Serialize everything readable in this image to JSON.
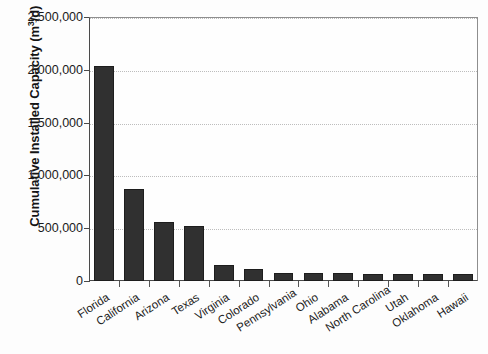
{
  "chart_data": {
    "type": "bar",
    "title": "",
    "xlabel": "",
    "ylabel_plain": "Cumulative Installed Capacity (m3/d)",
    "ylabel_prefix": "Cumulative Installed Capacity (m",
    "ylabel_exponent": "3",
    "ylabel_suffix": "/d)",
    "categories": [
      "Florida",
      "California",
      "Arizona",
      "Texas",
      "Virginia",
      "Colorado",
      "Pennsylvania",
      "Ohio",
      "Alabama",
      "North Carolina",
      "Utah",
      "Oklahoma",
      "Hawaii"
    ],
    "values": [
      2040000,
      875000,
      560000,
      525000,
      150000,
      115000,
      78000,
      75000,
      72000,
      70000,
      70000,
      70000,
      70000
    ],
    "ylim": [
      0,
      2500000
    ],
    "ytick_values": [
      0,
      500000,
      1000000,
      1500000,
      2000000,
      2500000
    ],
    "ytick_labels": [
      "0",
      "500,000",
      "1,000,000",
      "1,500,000",
      "2,000,000",
      "2,500,000"
    ],
    "grid": true,
    "grid_style": "dotted-horizontal",
    "legend": "none",
    "bar_color": "#303030",
    "bar_edge_color": "#1d1d1d",
    "background_color": "#fdfdfd",
    "axis_color": "#4a4a4a",
    "grid_color": "#bdbdbd"
  }
}
